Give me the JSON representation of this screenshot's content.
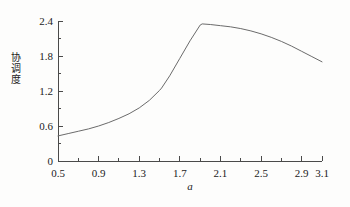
{
  "chart_data": {
    "type": "line",
    "title": "",
    "xlabel": "a",
    "ylabel": "协调度",
    "xlim": [
      0.5,
      3.1
    ],
    "ylim": [
      0,
      2.4
    ],
    "grid": false,
    "legend": null,
    "x_ticks_major": [
      "0.5",
      "0.9",
      "1.3",
      "1.7",
      "2.1",
      "2.5",
      "2.9",
      "3.1"
    ],
    "x_tick_values_major": [
      0.5,
      0.9,
      1.3,
      1.7,
      2.1,
      2.5,
      2.9,
      3.1
    ],
    "x_tick_values_minor": [
      0.7,
      1.1,
      1.5,
      1.9,
      2.3,
      2.7
    ],
    "y_ticks_major": [
      "0",
      "0.6",
      "1.2",
      "1.8",
      "2.4"
    ],
    "y_tick_values_major": [
      0,
      0.6,
      1.2,
      1.8,
      2.4
    ],
    "y_tick_values_minor": [
      0.3,
      0.9,
      1.5,
      2.1
    ],
    "series": [
      {
        "name": "协调度",
        "color": "#6b6b6b",
        "x": [
          0.5,
          0.6,
          0.7,
          0.8,
          0.9,
          1.0,
          1.1,
          1.2,
          1.3,
          1.4,
          1.5,
          1.52,
          1.6,
          1.7,
          1.8,
          1.9,
          1.92,
          2.0,
          2.1,
          2.2,
          2.3,
          2.4,
          2.5,
          2.6,
          2.7,
          2.8,
          2.9,
          3.0,
          3.1
        ],
        "y": [
          0.43,
          0.47,
          0.51,
          0.55,
          0.6,
          0.66,
          0.73,
          0.81,
          0.91,
          1.04,
          1.21,
          1.25,
          1.46,
          1.76,
          2.06,
          2.33,
          2.35,
          2.34,
          2.32,
          2.3,
          2.27,
          2.23,
          2.18,
          2.12,
          2.05,
          1.97,
          1.88,
          1.79,
          1.7
        ]
      }
    ],
    "annotations": {
      "kink_point": {
        "x": 1.52,
        "y": 1.25
      },
      "peak_point": {
        "x": 1.92,
        "y": 2.35
      },
      "start_point": {
        "x": 0.5,
        "y": 0.43
      },
      "end_point": {
        "x": 3.1,
        "y": 1.7
      }
    },
    "ylabel_chars": [
      "协",
      "调",
      "度"
    ],
    "colors": {
      "axis": "#4a4a4a",
      "curve": "#6b6b6b",
      "text": "#1b1b1b",
      "background": "#fdfdfc"
    }
  }
}
